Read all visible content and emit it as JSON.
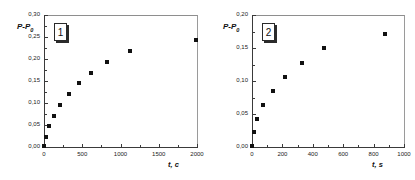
{
  "figure": {
    "panels": [
      {
        "badge_label": "1",
        "ylabel": "P-P",
        "ylabel_sub": "0",
        "xlabel": "t, c",
        "y_ticks": [
          "0,00",
          "0,05",
          "0,10",
          "0,15",
          "0,20",
          "0,25",
          "0,30"
        ],
        "x_ticks": [
          "0",
          "500",
          "1000",
          "1500",
          "2000"
        ]
      },
      {
        "badge_label": "2",
        "ylabel": "P-P",
        "ylabel_sub": "0",
        "xlabel": "t, s",
        "y_ticks": [
          "0,00",
          "0,05",
          "0,10",
          "0,15",
          "0,20"
        ],
        "x_ticks": [
          "0",
          "200",
          "400",
          "600",
          "800",
          "1000"
        ]
      }
    ]
  },
  "chart_data": [
    {
      "type": "scatter",
      "panel": "1",
      "title": "",
      "xlabel": "t, c",
      "ylabel": "P-P0",
      "xlim": [
        0,
        2000
      ],
      "ylim": [
        0.0,
        0.3
      ],
      "xticks": [
        0,
        500,
        1000,
        1500,
        2000
      ],
      "yticks": [
        0.0,
        0.05,
        0.1,
        0.15,
        0.2,
        0.25,
        0.3
      ],
      "xtick_labels": [
        "0",
        "500",
        "1000",
        "1500",
        "2000"
      ],
      "ytick_labels": [
        "0,00",
        "0,05",
        "0,10",
        "0,15",
        "0,20",
        "0,25",
        "0,30"
      ],
      "grid": false,
      "legend": false,
      "marker": "filled-square",
      "marker_color": "#111111",
      "x": [
        5,
        20,
        60,
        125,
        215,
        330,
        455,
        615,
        820,
        1120,
        1990
      ],
      "y": [
        0.002,
        0.023,
        0.047,
        0.071,
        0.096,
        0.12,
        0.145,
        0.169,
        0.193,
        0.218,
        0.243
      ],
      "annotations": [
        "1"
      ]
    },
    {
      "type": "scatter",
      "panel": "2",
      "title": "",
      "xlabel": "t, s",
      "ylabel": "P-P0",
      "xlim": [
        0,
        1000
      ],
      "ylim": [
        0.0,
        0.2
      ],
      "xticks": [
        0,
        200,
        400,
        600,
        800,
        1000
      ],
      "yticks": [
        0.0,
        0.05,
        0.1,
        0.15,
        0.2
      ],
      "xtick_labels": [
        "0",
        "200",
        "400",
        "600",
        "800",
        "1000"
      ],
      "ytick_labels": [
        "0,00",
        "0,05",
        "0,10",
        "0,15",
        "0,20"
      ],
      "grid": false,
      "legend": false,
      "marker": "filled-square",
      "marker_color": "#111111",
      "x": [
        3,
        12,
        35,
        72,
        138,
        215,
        328,
        472,
        878
      ],
      "y": [
        0.001,
        0.022,
        0.043,
        0.064,
        0.085,
        0.106,
        0.128,
        0.15,
        0.171
      ],
      "annotations": [
        "2"
      ]
    }
  ]
}
